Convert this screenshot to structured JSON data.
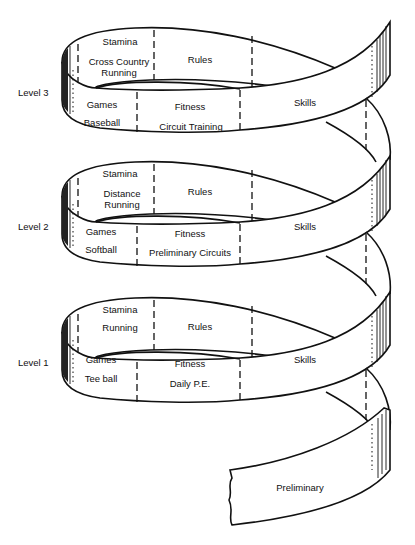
{
  "diagram": {
    "type": "spiral-curriculum",
    "levels": [
      {
        "name": "Level 3",
        "segments": {
          "stamina": {
            "title": "Stamina",
            "activity": "Cross Country Running"
          },
          "rules": {
            "title": "Rules"
          },
          "games": {
            "title": "Games",
            "activity": "Baseball"
          },
          "fitness": {
            "title": "Fitness",
            "activity": "Circuit Training"
          },
          "skills": {
            "title": "Skills"
          }
        }
      },
      {
        "name": "Level 2",
        "segments": {
          "stamina": {
            "title": "Stamina",
            "activity": "Distance Running"
          },
          "rules": {
            "title": "Rules"
          },
          "games": {
            "title": "Games",
            "activity": "Softball"
          },
          "fitness": {
            "title": "Fitness",
            "activity": "Preliminary Circuits"
          },
          "skills": {
            "title": "Skills"
          }
        }
      },
      {
        "name": "Level 1",
        "segments": {
          "stamina": {
            "title": "Stamina",
            "activity": "Running"
          },
          "rules": {
            "title": "Rules"
          },
          "games": {
            "title": "Games",
            "activity": "Tee ball"
          },
          "fitness": {
            "title": "Fitness",
            "activity": "Daily P.E."
          },
          "skills": {
            "title": "Skills"
          }
        }
      }
    ],
    "base": {
      "title": "Preliminary"
    },
    "labels": {
      "l3_stamina_line1": "Cross Country",
      "l3_stamina_line2": "Running",
      "l2_stamina_line1": "Distance",
      "l2_stamina_line2": "Running"
    }
  }
}
